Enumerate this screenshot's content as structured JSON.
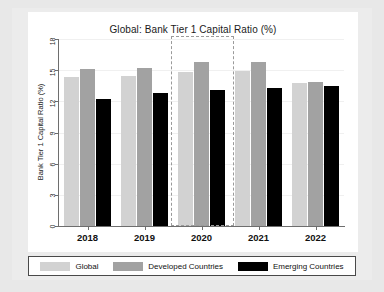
{
  "chart_data": {
    "type": "bar",
    "title": "Global: Bank Tier 1 Capital Ratio (%)",
    "xlabel": "",
    "ylabel": "Bank Tier 1 Capital Ratio (%)",
    "categories": [
      "2018",
      "2019",
      "2020",
      "2021",
      "2022"
    ],
    "series": [
      {
        "name": "Global",
        "color": "#d2d2d2",
        "values": [
          14.3,
          14.4,
          14.8,
          14.9,
          13.8
        ]
      },
      {
        "name": "Developed Countries",
        "color": "#a2a2a2",
        "values": [
          15.1,
          15.2,
          15.8,
          15.8,
          13.9
        ]
      },
      {
        "name": "Emerging Countries",
        "color": "#000000",
        "values": [
          12.2,
          12.8,
          13.1,
          13.3,
          13.5
        ]
      }
    ],
    "ylim": [
      0,
      18
    ],
    "yticks": [
      0,
      3,
      6,
      9,
      12,
      15,
      18
    ],
    "ytick_labels": [
      "0",
      "3",
      "6",
      "9",
      "12",
      "15",
      "18"
    ],
    "grid": true,
    "legend_position": "bottom",
    "annotations": [
      {
        "type": "dashed-rectangle",
        "name": "highlight-2020",
        "category": "2020",
        "label": ""
      }
    ]
  },
  "legend": {
    "items": [
      {
        "label": "Global",
        "color": "#d2d2d2"
      },
      {
        "label": "Developed Countries",
        "color": "#a2a2a2"
      },
      {
        "label": "Emerging Countries",
        "color": "#000000"
      }
    ]
  }
}
